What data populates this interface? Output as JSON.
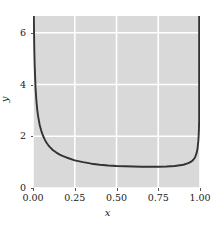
{
  "chart_data": {
    "type": "line",
    "title": "",
    "xlabel": "x",
    "ylabel": "y",
    "xlim": [
      0.0,
      1.0
    ],
    "ylim": [
      0.0,
      6.65
    ],
    "grid": true,
    "legend": null,
    "style": "darkgrid",
    "line_color": "#333333",
    "background_color": "#d9d9d9",
    "grid_color": "#ffffff",
    "xticks": [
      {
        "value": 0.0,
        "label": "0.00"
      },
      {
        "value": 0.25,
        "label": "0.25"
      },
      {
        "value": 0.5,
        "label": "0.50"
      },
      {
        "value": 0.75,
        "label": "0.75"
      },
      {
        "value": 1.0,
        "label": "1.00"
      }
    ],
    "yticks": [
      {
        "value": 0,
        "label": "0"
      },
      {
        "value": 2,
        "label": "2"
      },
      {
        "value": 4,
        "label": "4"
      },
      {
        "value": 6,
        "label": "6"
      }
    ],
    "series": [
      {
        "name": "curve",
        "x": [
          0.005,
          0.0075,
          0.01,
          0.015,
          0.02,
          0.025,
          0.03,
          0.04,
          0.05,
          0.06,
          0.07,
          0.08,
          0.09,
          0.1,
          0.12,
          0.14,
          0.16,
          0.18,
          0.2,
          0.25,
          0.3,
          0.35,
          0.4,
          0.45,
          0.5,
          0.55,
          0.6,
          0.65,
          0.7,
          0.75,
          0.8,
          0.85,
          0.9,
          0.93,
          0.95,
          0.96,
          0.97,
          0.98,
          0.985,
          0.99,
          0.993,
          0.995
        ],
        "y": [
          6.62,
          5.45,
          4.75,
          3.9,
          3.4,
          3.05,
          2.8,
          2.44,
          2.2,
          2.02,
          1.88,
          1.76,
          1.67,
          1.59,
          1.46,
          1.37,
          1.29,
          1.23,
          1.18,
          1.07,
          1.0,
          0.94,
          0.9,
          0.87,
          0.85,
          0.84,
          0.83,
          0.82,
          0.82,
          0.82,
          0.83,
          0.85,
          0.9,
          0.96,
          1.03,
          1.09,
          1.18,
          1.36,
          1.52,
          1.82,
          2.15,
          2.6
        ]
      }
    ]
  }
}
